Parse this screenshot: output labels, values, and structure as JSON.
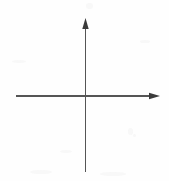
{
  "figure": {
    "title": "Blank Cartesian coordinate axes",
    "kind": "coordinate-axes-diagram",
    "background_color": "#fefefe",
    "line_color": "#555555",
    "line_width_px": 1.2,
    "canvas": {
      "width": 169,
      "height": 181
    }
  },
  "chart_data": {
    "type": "scatter",
    "title": "",
    "subtitle": "",
    "xlabel": "",
    "ylabel": "",
    "series": [
      {
        "name": "",
        "x": [],
        "y": []
      }
    ],
    "categories": [],
    "values": [],
    "x": [],
    "xlim": [
      -69,
      75
    ],
    "ylim": [
      -76,
      78
    ],
    "grid": false,
    "legend": false,
    "legend_position": "none",
    "tick_labels_x": [],
    "tick_labels_y": [],
    "annotations": []
  },
  "axes": {
    "origin": {
      "x": 85,
      "y": 96
    },
    "x_axis": {
      "name": "horizontal-axis",
      "start_x": 16,
      "end_x": 160,
      "y": 96,
      "arrow_at": "end",
      "arrow_direction": "right",
      "label": ""
    },
    "y_axis": {
      "name": "vertical-axis",
      "x": 85,
      "start_y": 172,
      "end_y": 18,
      "arrow_at": "start",
      "arrow_direction": "up",
      "label": ""
    },
    "arrowhead": {
      "length_px": 11,
      "half_width_px": 3.2,
      "fill": "#3a3a3a"
    }
  },
  "artifacts": [
    {
      "name": "scan-speck",
      "x": 86,
      "y": 3,
      "w": 7,
      "h": 6
    },
    {
      "name": "scan-speck",
      "x": 128,
      "y": 128,
      "w": 5,
      "h": 7
    },
    {
      "name": "scan-speck",
      "x": 133,
      "y": 134,
      "w": 3,
      "h": 3
    },
    {
      "name": "scan-speck",
      "x": 30,
      "y": 170,
      "w": 22,
      "h": 4
    },
    {
      "name": "scan-speck",
      "x": 100,
      "y": 172,
      "w": 26,
      "h": 4
    },
    {
      "name": "scan-speck",
      "x": 12,
      "y": 60,
      "w": 14,
      "h": 3
    },
    {
      "name": "scan-speck",
      "x": 140,
      "y": 40,
      "w": 10,
      "h": 3
    },
    {
      "name": "scan-speck",
      "x": 60,
      "y": 150,
      "w": 12,
      "h": 3
    }
  ]
}
